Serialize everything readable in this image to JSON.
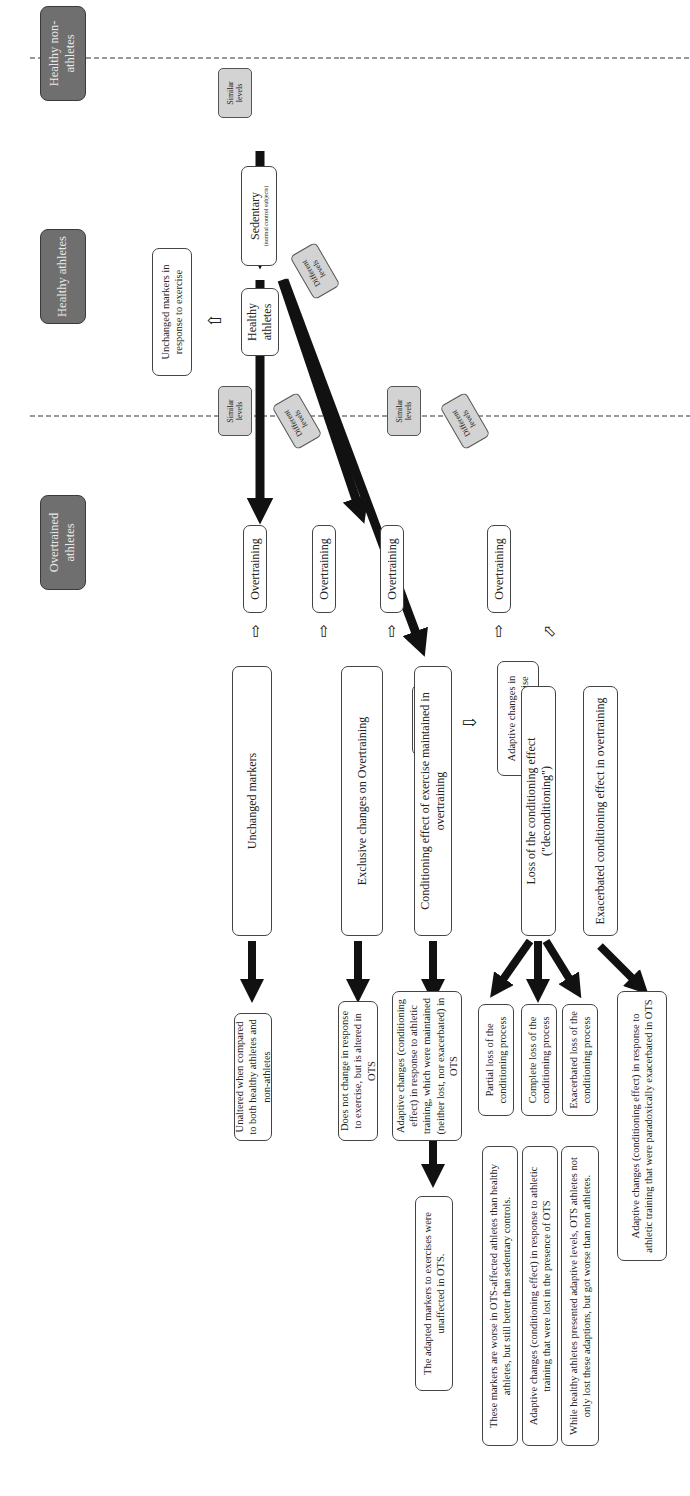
{
  "headers": {
    "non_athletes": "Healthy non-athletes",
    "healthy_athletes": "Healthy athletes",
    "overtrained": "Overtrained athletes"
  },
  "nodes": {
    "sedentary": {
      "title": "Sedentary",
      "subtitle": "(normal control subjects)"
    },
    "healthy_athletes_a": "Healthy athletes",
    "healthy_athletes_b": "Healthy athletes",
    "unchanged_in_response": "Unchanged markers in response to exercise",
    "adaptive_in_response": "Adaptive changes in response to exercise",
    "overtraining_1": "Overtraining",
    "overtraining_2": "Overtraining",
    "overtraining_3": "Overtraining",
    "overtraining_4": "Overtraining"
  },
  "tags": {
    "similar_1": "Similar levels",
    "different_1": "Different levels",
    "similar_2": "Similar levels",
    "different_2": "Different levels",
    "similar_3": "Similar levels",
    "different_3": "Different levels"
  },
  "outcomes": [
    {
      "label": "Unchanged markers",
      "result": "Unaltered when compared to both healthy athletes and non-athletes"
    },
    {
      "label": "Exclusive changes on Overtraining",
      "result": "Does not change in response to exercise, but is altered in OTS"
    },
    {
      "label": "Conditioning effect of exercise maintained in overtraining",
      "result": "Adaptive changes (conditioning effect) in response to athletic training, which were maintained (neither lost, nor exacerbated) in OTS",
      "final": "The adapted markers to exercises were unaffected in OTS."
    },
    {
      "label": "Loss of the conditioning effect (\"deconditioning\")"
    },
    {
      "label": "Exacerbated conditioning effect in overtraining",
      "result": "Adaptive changes (conditioning effect) in response to athletic training that were paradoxically exacerbated in OTS"
    }
  ],
  "deconditioning": [
    {
      "label": "Partial loss of the conditioning process",
      "result": "These markers are worse in OTS-affected athletes than healthy athletes, but still better than sedentary controls."
    },
    {
      "label": "Complete loss of the conditioning process",
      "result": "Adaptive changes (conditioning effect) in response to athletic training that were lost in the presence of OTS"
    },
    {
      "label": "Exacerbated loss of the conditioning process",
      "result": "While healthy athletes presented adaptive levels, OTS athletes not only lost these adaptions, but got worse than non athletes."
    }
  ]
}
